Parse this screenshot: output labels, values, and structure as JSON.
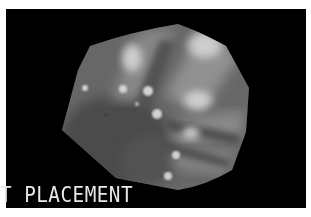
{
  "image": {
    "description": "Grayscale diffraction pattern inside a hexagonal aperture on black background",
    "caption": "T PLACEMENT",
    "colors": {
      "background": "#000000",
      "border": "#ffffff",
      "caption": "#e8e8e8"
    },
    "bright_spots": [
      {
        "cx": 205,
        "cy": 45,
        "rx": 20,
        "ry": 15,
        "intensity": 1.0
      },
      {
        "cx": 132,
        "cy": 58,
        "rx": 12,
        "ry": 16,
        "intensity": 0.95
      },
      {
        "cx": 198,
        "cy": 100,
        "rx": 16,
        "ry": 11,
        "intensity": 1.0
      },
      {
        "cx": 191,
        "cy": 133,
        "rx": 10,
        "ry": 7,
        "intensity": 0.95
      },
      {
        "cx": 85,
        "cy": 88,
        "rx": 3,
        "ry": 3,
        "intensity": 0.9
      },
      {
        "cx": 123,
        "cy": 89,
        "rx": 4,
        "ry": 4,
        "intensity": 0.95
      },
      {
        "cx": 148,
        "cy": 91,
        "rx": 5,
        "ry": 5,
        "intensity": 1.0
      },
      {
        "cx": 157,
        "cy": 114,
        "rx": 5,
        "ry": 5,
        "intensity": 1.0
      },
      {
        "cx": 137,
        "cy": 104,
        "rx": 2,
        "ry": 2,
        "intensity": 0.8
      },
      {
        "cx": 176,
        "cy": 155,
        "rx": 4,
        "ry": 4,
        "intensity": 1.0
      },
      {
        "cx": 168,
        "cy": 176,
        "rx": 4,
        "ry": 4,
        "intensity": 1.0
      }
    ]
  }
}
